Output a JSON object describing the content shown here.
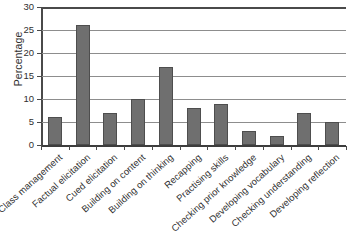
{
  "chart_data": {
    "type": "bar",
    "title": "",
    "subtitle": "",
    "xlabel": "",
    "ylabel": "Percentage",
    "ylim": [
      0,
      30
    ],
    "yticks": [
      0,
      5,
      10,
      15,
      20,
      25,
      30
    ],
    "ytick_labels": [
      "0",
      "5",
      "10",
      "15",
      "20",
      "25",
      "30"
    ],
    "grid": true,
    "legend": false,
    "legend_position": "none",
    "bar_color": "#6f6f6f",
    "bar_edge_color": "#4e4e4e",
    "categories": [
      "Class management",
      "Factual elicitation",
      "Cued elicitation",
      "Building on content",
      "Building on thinking",
      "Recapping",
      "Practising skills",
      "Checking prior knowledge",
      "Developing vocabulary",
      "Checking understanding",
      "Developing reflection"
    ],
    "values": [
      6,
      26,
      7,
      10,
      17,
      8,
      9,
      3,
      2,
      7,
      5
    ]
  }
}
